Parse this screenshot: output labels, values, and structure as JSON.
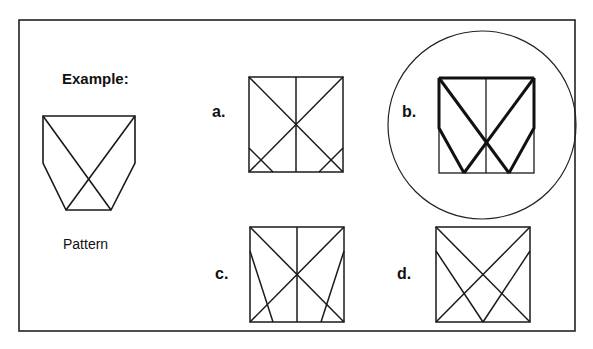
{
  "title": "Example:",
  "pattern_caption": "Pattern",
  "options": [
    {
      "label": "a.",
      "selected": false
    },
    {
      "label": "b.",
      "selected": true
    },
    {
      "label": "c.",
      "selected": false
    },
    {
      "label": "d.",
      "selected": false
    }
  ],
  "colors": {
    "line": "#1a1a1a",
    "background": "#ffffff"
  }
}
